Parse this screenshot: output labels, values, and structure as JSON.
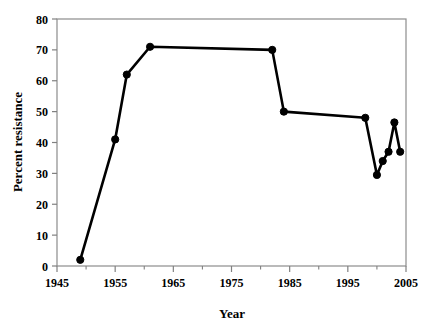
{
  "chart_data": {
    "type": "line",
    "title": "",
    "xlabel": "Year",
    "ylabel": "Percent resistance",
    "xlim": [
      1945,
      2005
    ],
    "ylim": [
      0,
      80
    ],
    "xticks": [
      1945,
      1955,
      1965,
      1975,
      1985,
      1995,
      2005
    ],
    "xtick_labels": [
      "1945",
      "1955",
      "1965",
      "1975",
      "1985",
      "1995",
      "2005"
    ],
    "xminor_ticks": [
      1950,
      1960,
      1970,
      1980,
      1990,
      2000
    ],
    "yticks": [
      0,
      10,
      20,
      30,
      40,
      50,
      60,
      70,
      80
    ],
    "ytick_labels": [
      "0",
      "10",
      "20",
      "30",
      "40",
      "50",
      "60",
      "70",
      "80"
    ],
    "grid": false,
    "legend": "none",
    "marker": "filled-circle",
    "line_color": "#000000",
    "marker_color": "#000000",
    "axis_color": "#808080",
    "series": [
      {
        "name": "Percent resistance",
        "x": [
          1949,
          1955,
          1957,
          1961,
          1982,
          1984,
          1998,
          2000,
          2001,
          2002,
          2003,
          2004
        ],
        "y": [
          2,
          41,
          62,
          71,
          70,
          50,
          48,
          29.5,
          34,
          37,
          46.5,
          37
        ]
      }
    ]
  },
  "axes": {
    "y_title": "Percent resistance",
    "x_title": "Year"
  }
}
